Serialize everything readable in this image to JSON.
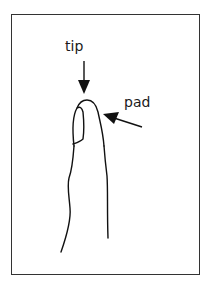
{
  "diagram": {
    "labels": {
      "tip": "tip",
      "pad": "pad"
    },
    "figure": "finger-outline",
    "arrows": [
      {
        "name": "tip-arrow",
        "points_to": "tip"
      },
      {
        "name": "pad-arrow",
        "points_to": "pad"
      }
    ],
    "colors": {
      "line": "#111111",
      "border": "#333333",
      "background": "#ffffff"
    }
  }
}
